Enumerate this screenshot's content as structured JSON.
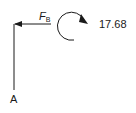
{
  "diagram": {
    "type": "free-body-diagram",
    "force_label": {
      "symbol": "F",
      "subscript": "B"
    },
    "moment_value": "17.68",
    "moment_direction": "clockwise",
    "point_label": "A",
    "colors": {
      "stroke": "#1a1a1a",
      "background": "#ffffff"
    }
  }
}
